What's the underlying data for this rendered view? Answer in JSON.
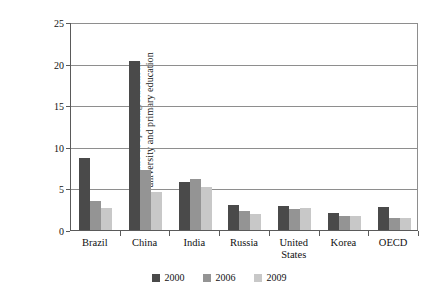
{
  "chart_data": {
    "type": "bar",
    "title": "",
    "xlabel": "",
    "ylabel_line1": "Ratio of spending/student in",
    "ylabel_line2": "university and primary education",
    "ylabel": "Ratio of spending/student in university and primary education",
    "ylim": [
      0,
      25
    ],
    "yticks": [
      0,
      5,
      10,
      15,
      20,
      25
    ],
    "ytick_labels": [
      "0",
      "5",
      "10",
      "15",
      "20",
      "25"
    ],
    "grid": true,
    "grid_axis": "y",
    "legend_position": "bottom-center",
    "categories": [
      "Brazil",
      "China",
      "India",
      "Russia",
      "United States",
      "Korea",
      "OECD"
    ],
    "category_labels": [
      [
        "Brazil"
      ],
      [
        "China"
      ],
      [
        "India"
      ],
      [
        "Russia"
      ],
      [
        "United",
        "States"
      ],
      [
        "Korea"
      ],
      [
        "OECD"
      ]
    ],
    "series": [
      {
        "name": "2000",
        "color": "#4a4a4a",
        "values": [
          8.7,
          20.3,
          5.8,
          3.0,
          2.9,
          2.1,
          2.8
        ]
      },
      {
        "name": "2006",
        "color": "#949494",
        "values": [
          3.5,
          7.2,
          6.1,
          2.3,
          2.5,
          1.7,
          1.5
        ]
      },
      {
        "name": "2009",
        "color": "#c8c8c8",
        "values": [
          2.6,
          4.6,
          5.2,
          1.9,
          2.6,
          1.7,
          1.4
        ]
      }
    ]
  },
  "legend": {
    "items": [
      {
        "label": "2000",
        "color": "#4a4a4a"
      },
      {
        "label": "2006",
        "color": "#949494"
      },
      {
        "label": "2009",
        "color": "#c8c8c8"
      }
    ]
  },
  "colors": {
    "series_2000": "#4a4a4a",
    "series_2006": "#949494",
    "series_2009": "#c8c8c8",
    "axis": "#5a5a5a",
    "grid": "#8e8e8e",
    "background": "#ffffff",
    "text": "#111111"
  }
}
